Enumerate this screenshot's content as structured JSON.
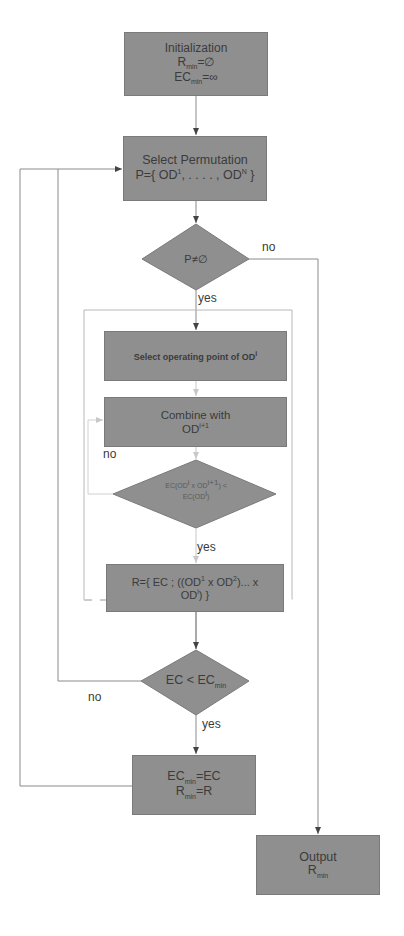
{
  "diagram": {
    "type": "flowchart",
    "colors": {
      "node_fill": "#8f8f8f",
      "line": "#8a8a8a",
      "text": "#3b3b3b",
      "dashed_frame": "#b0b0b0"
    },
    "nodes": {
      "init": {
        "title": "Initialization",
        "line2_main": "R",
        "line2_sub": "min",
        "line2_rest": "=∅",
        "line3_main": "EC",
        "line3_sub": "min",
        "line3_rest": "=∞"
      },
      "select_perm": {
        "title": "Select Permutation",
        "line2_pre": "P={ OD",
        "line2_sup1": "1",
        "line2_mid": ", . . . . , OD",
        "line2_sup2": "N",
        "line2_post": " }"
      },
      "decision_p": {
        "label": "P≠∅"
      },
      "select_op": {
        "label_pre": "Select operating point of OD",
        "label_sup": "i"
      },
      "combine": {
        "title": "Combine with",
        "line2_pre": "OD",
        "line2_sup": "i+1"
      },
      "decision_ec": {
        "line1_pre": "EC(OD",
        "line1_sup1": "i",
        "line1_mid": " x OD",
        "line1_sup2": "i+1",
        "line1_post": ") <",
        "line2_pre": "EC(OD",
        "line2_sup": "i",
        "line2_post": ")"
      },
      "result_r": {
        "line1_pre": "R={ EC ; ((OD",
        "line1_sup1": "1",
        "line1_mid": " x OD",
        "line1_sup2": "2",
        "line1_post": ")... x",
        "line2_pre": "OD",
        "line2_sup": "i",
        "line2_post": ") }"
      },
      "decision_min": {
        "pre": "EC < EC",
        "sub": "min"
      },
      "update_min": {
        "line1_main": "EC",
        "line1_sub": "min",
        "line1_rest": "=EC",
        "line2_main": "R",
        "line2_sub": "min",
        "line2_rest": "=R"
      },
      "output": {
        "title": "Output",
        "line2_main": "R",
        "line2_sub": "min"
      }
    },
    "edge_labels": {
      "p_no": "no",
      "p_yes": "yes",
      "inner_no": "no",
      "inner_yes": "yes",
      "min_no": "no",
      "min_yes": "yes"
    }
  }
}
